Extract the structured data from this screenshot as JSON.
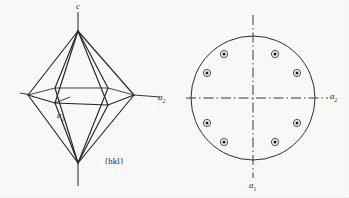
{
  "figure": {
    "kind": "crystallography-figure",
    "ink_color": "#262626",
    "axis_color": "#3a3a3a",
    "background_color": "#fdfdfc"
  },
  "left_panel": {
    "name": "crystal-habit-drawing",
    "form_label": "{hkl}",
    "axes": [
      {
        "id": "c",
        "label": "c",
        "sub": "",
        "orientation": "vertical"
      },
      {
        "id": "a1",
        "label": "a",
        "sub": "1",
        "orientation": "front-left-to-back-right"
      },
      {
        "id": "a2",
        "label": "a",
        "sub": "2",
        "orientation": "horizontal"
      }
    ],
    "crystal": {
      "type": "bipyramid",
      "apex_top": [
        78,
        31
      ],
      "apex_bottom": [
        78,
        163
      ],
      "equator_vertices": [
        [
          28,
          95
        ],
        [
          55,
          103
        ],
        [
          108,
          105
        ],
        [
          134,
          95
        ],
        [
          108,
          88
        ],
        [
          55,
          88
        ]
      ],
      "faces_count": 8
    }
  },
  "right_panel": {
    "name": "stereographic-projection",
    "axes": [
      {
        "id": "a2",
        "label": "a",
        "sub": "2",
        "orientation": "horizontal"
      },
      {
        "id": "a1",
        "label": "a",
        "sub": "1",
        "orientation": "vertical"
      }
    ],
    "primitive_circle": {
      "center_x": 253,
      "center_y": 98,
      "radius": 62
    },
    "poles": [
      {
        "index": 1,
        "cx": 224,
        "cy": 54,
        "type": "upper-hemisphere"
      },
      {
        "index": 2,
        "cx": 275,
        "cy": 54,
        "type": "upper-hemisphere"
      },
      {
        "index": 3,
        "cx": 207,
        "cy": 73,
        "type": "upper-hemisphere"
      },
      {
        "index": 4,
        "cx": 297,
        "cy": 73,
        "type": "upper-hemisphere"
      },
      {
        "index": 5,
        "cx": 207,
        "cy": 123,
        "type": "upper-hemisphere"
      },
      {
        "index": 6,
        "cx": 297,
        "cy": 123,
        "type": "upper-hemisphere"
      },
      {
        "index": 7,
        "cx": 224,
        "cy": 142,
        "type": "upper-hemisphere"
      },
      {
        "index": 8,
        "cx": 275,
        "cy": 142,
        "type": "upper-hemisphere"
      }
    ],
    "pole_symbol": "dot-in-circle"
  }
}
